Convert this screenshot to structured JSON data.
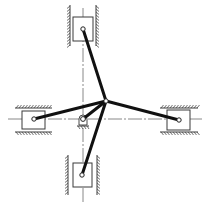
{
  "diagram": {
    "title": "",
    "type": "multi-slider linkage mechanism",
    "colors": {
      "background": "#ffffff",
      "link": "#111111",
      "outline": "#3a3a3a",
      "centerline": "#6a6a6a"
    },
    "central_joint": {
      "x": 106,
      "y": 101
    },
    "fixed_pivot": {
      "x": 83,
      "y": 119
    },
    "centerlines": {
      "horizontal": {
        "y": 119,
        "x1": 8,
        "x2": 203
      },
      "vertical": {
        "x": 83,
        "y1": 8,
        "y2": 203
      }
    },
    "sliders": [
      {
        "id": "top",
        "orientation": "vertical",
        "block": {
          "x": 73,
          "y": 17,
          "w": 20,
          "h": 24
        },
        "pin": {
          "x": 83,
          "y": 29
        },
        "guides": {
          "a": 70,
          "b": 96,
          "from": 5,
          "to": 46
        }
      },
      {
        "id": "left",
        "orientation": "horizontal",
        "block": {
          "x": 22,
          "y": 111,
          "w": 23,
          "h": 18
        },
        "pin": {
          "x": 34,
          "y": 119
        },
        "guides": {
          "a": 108,
          "b": 132,
          "from": 15,
          "to": 52
        }
      },
      {
        "id": "right",
        "orientation": "horizontal",
        "block": {
          "x": 167,
          "y": 110,
          "w": 23,
          "h": 20
        },
        "pin": {
          "x": 179,
          "y": 120
        },
        "guides": {
          "a": 108,
          "b": 132,
          "from": 160,
          "to": 198
        }
      },
      {
        "id": "bottom",
        "orientation": "vertical",
        "block": {
          "x": 73,
          "y": 163,
          "w": 19,
          "h": 24
        },
        "pin": {
          "x": 82,
          "y": 175
        },
        "guides": {
          "a": 68,
          "b": 97,
          "from": 155,
          "to": 195
        }
      }
    ],
    "links": [
      {
        "id": "top-link",
        "from": "top",
        "x1": 83,
        "y1": 29,
        "x2": 106,
        "y2": 101
      },
      {
        "id": "left-link",
        "from": "left",
        "x1": 34,
        "y1": 119,
        "x2": 106,
        "y2": 101
      },
      {
        "id": "right-link",
        "from": "right",
        "x1": 179,
        "y1": 120,
        "x2": 106,
        "y2": 101
      },
      {
        "id": "bottom-link",
        "from": "bottom",
        "x1": 82,
        "y1": 175,
        "x2": 106,
        "y2": 101
      },
      {
        "id": "crank",
        "from": "fixed_pivot",
        "x1": 83,
        "y1": 119,
        "x2": 106,
        "y2": 101
      }
    ],
    "labels": []
  }
}
